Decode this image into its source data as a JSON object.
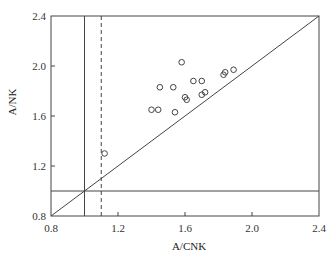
{
  "chart_data": {
    "type": "scatter",
    "title": "",
    "xlabel": "A/CNK",
    "ylabel": "A/NK",
    "xlim": [
      0.8,
      2.4
    ],
    "ylim": [
      0.8,
      2.4
    ],
    "xticks": [
      0.8,
      1.2,
      1.6,
      2.0,
      2.4
    ],
    "yticks": [
      0.8,
      1.2,
      1.6,
      2.0,
      2.4
    ],
    "xtick_labels": [
      "0.8",
      "1.2",
      "1.6",
      "2.0",
      "2.4"
    ],
    "ytick_labels": [
      "0.8",
      "1.2",
      "1.6",
      "2.0",
      "2.4"
    ],
    "grid": false,
    "legend": null,
    "marker": "open-circle",
    "points": [
      {
        "x": 1.12,
        "y": 1.3
      },
      {
        "x": 1.4,
        "y": 1.65
      },
      {
        "x": 1.44,
        "y": 1.65
      },
      {
        "x": 1.45,
        "y": 1.83
      },
      {
        "x": 1.53,
        "y": 1.83
      },
      {
        "x": 1.54,
        "y": 1.63
      },
      {
        "x": 1.58,
        "y": 2.03
      },
      {
        "x": 1.6,
        "y": 1.75
      },
      {
        "x": 1.61,
        "y": 1.73
      },
      {
        "x": 1.65,
        "y": 1.88
      },
      {
        "x": 1.7,
        "y": 1.88
      },
      {
        "x": 1.7,
        "y": 1.77
      },
      {
        "x": 1.72,
        "y": 1.79
      },
      {
        "x": 1.83,
        "y": 1.93
      },
      {
        "x": 1.84,
        "y": 1.95
      },
      {
        "x": 1.89,
        "y": 1.97
      }
    ],
    "reference_lines": [
      {
        "kind": "vertical",
        "x": 1.0,
        "style": "solid"
      },
      {
        "kind": "vertical",
        "x": 1.1,
        "style": "dashed"
      },
      {
        "kind": "horizontal",
        "y": 1.0,
        "style": "solid"
      },
      {
        "kind": "diagonal",
        "from": [
          0.8,
          0.8
        ],
        "to": [
          2.4,
          2.4
        ],
        "style": "solid"
      }
    ]
  },
  "colors": {
    "line": "#444444",
    "marker": "#444444",
    "background": "#ffffff"
  },
  "layout": {
    "plot_left": 51,
    "plot_top": 16,
    "plot_right": 319,
    "plot_bottom": 216
  }
}
